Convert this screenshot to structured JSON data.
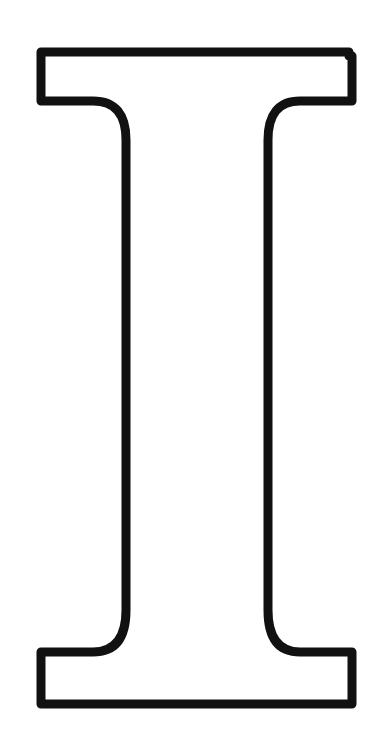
{
  "glyph": {
    "character": "I",
    "style": "outline",
    "stroke_color": "#111111",
    "fill_color": "#ffffff",
    "background": "#ffffff"
  }
}
